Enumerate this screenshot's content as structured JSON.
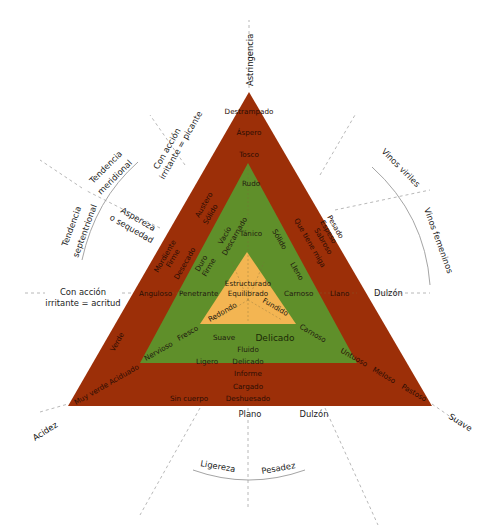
{
  "colors": {
    "outer_triangle": "#9c2f08",
    "middle_triangle": "#5f8f2a",
    "inner_triangle": "#f3b552",
    "background": "#ffffff",
    "dashed_lines": "#b0b0b0"
  },
  "vertices": {
    "top": "Astringencia",
    "left": "Acidez",
    "right": "Suave"
  },
  "outer_band": {
    "top": [
      "Destrampado",
      "Áspero",
      "Tosco"
    ],
    "left_upper": [
      "Austero",
      "Sólido"
    ],
    "left_mid": [
      "Mordiente",
      "Firme",
      "Desecado"
    ],
    "left_side": "Anguloso",
    "left_lower": "Verde",
    "left_base": "Muy verde Aciduado",
    "right_upper": [
      "Pesado",
      "Espeso",
      "Sabroso",
      "Que tiene miga"
    ],
    "right_side": "Llano",
    "right_base": [
      "Untuoso",
      "Meloso",
      "Pastoso"
    ],
    "bottom": [
      "Informe",
      "Cargado",
      "Deshuesado"
    ],
    "bottom_left": "Sin cuerpo"
  },
  "middle_band": {
    "top": "Rudo",
    "upper_center": "Tánico",
    "left_upper": [
      "Vacío",
      "Descarnado"
    ],
    "left_mid": [
      "Duro",
      "Firme"
    ],
    "left_side": "Penetrante",
    "left_lower": [
      "Nervioso",
      "Fresco"
    ],
    "right_upper": "Sólido",
    "right_mid": "Lleno",
    "right_side": "Carnoso",
    "right_lower": "Carnoso",
    "bottom_left": "Ligero",
    "bottom_center": [
      "Suave",
      "Fluido",
      "Delicado"
    ],
    "bottom_right": "Delicado"
  },
  "inner_triangle": {
    "center": [
      "Estructurado",
      "Equilibrado"
    ],
    "left": "Redondo",
    "right": "Fundido"
  },
  "outside_labels": {
    "left_axis": [
      "Con acción",
      "irritante = acritud"
    ],
    "upper_left_axis": [
      "Con acción",
      "irritante = picante"
    ],
    "upper_left_mid": [
      "Aspereza",
      "o sequedad"
    ],
    "tendency_meridional": [
      "Tendencia",
      "meridional"
    ],
    "tendency_septentrional": [
      "Tendencia",
      "septentrional"
    ],
    "right_axis": "Dulzón",
    "upper_right_arc_1": "Vinos viriles",
    "upper_right_arc_2": "Vinos femeninos",
    "bottom_plano": "Plano",
    "bottom_dulzon": "Dulzón",
    "bottom_arc_left": "Ligereza",
    "bottom_arc_right": "Pesadez"
  }
}
